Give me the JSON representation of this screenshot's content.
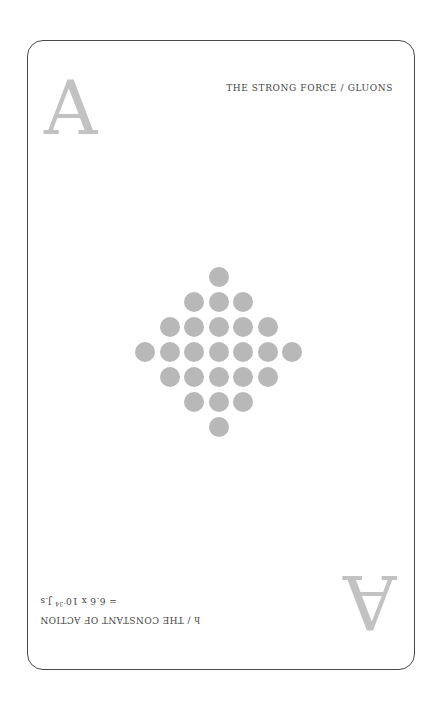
{
  "card": {
    "rank": "A",
    "title": "THE STRONG FORCE / GLUONS",
    "formula": {
      "line1": "h / THE CONSTANT OF ACTION",
      "line2_prefix": "= 6.6 x 10",
      "line2_exponent": "-34",
      "line2_suffix": " J.s"
    },
    "colors": {
      "border": "#4a4a4a",
      "rank": "#c2c2c2",
      "text": "#444444",
      "pip": "#b8b8b8"
    },
    "pip_pattern": {
      "shape": "diamond",
      "rows": [
        1,
        3,
        5,
        7,
        5,
        3,
        1
      ],
      "total": 25
    }
  }
}
